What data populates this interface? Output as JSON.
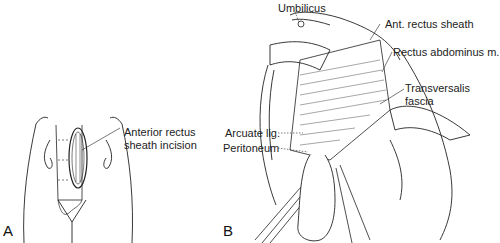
{
  "figure": {
    "panels": [
      {
        "id": "A",
        "letter": "A",
        "labels": [
          {
            "line1": "Anterior rectus",
            "line2": "sheath incision"
          }
        ]
      },
      {
        "id": "B",
        "letter": "B",
        "labels": [
          {
            "text": "Umbilicus"
          },
          {
            "text": "Ant. rectus sheath"
          },
          {
            "text": "Rectus abdominus m."
          },
          {
            "line1": "Transversalis",
            "line2": "fascia"
          },
          {
            "text": "Arcuate lig."
          },
          {
            "text": "Peritoneum"
          }
        ]
      }
    ]
  }
}
